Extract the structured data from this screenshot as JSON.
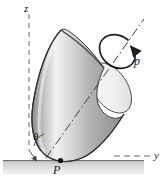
{
  "figure": {
    "background_color": "#ffffff",
    "width": 167,
    "height": 181
  },
  "axes": {
    "vertical": {
      "label": "z",
      "style": "dashed",
      "color": "#555555",
      "orientation": "vertical"
    },
    "horizontal": {
      "label": "y",
      "style": "dashed",
      "color": "#555555",
      "orientation": "horizontal"
    },
    "cone_axis": {
      "label": "",
      "style": "dash-dot",
      "color": "#4a4a4a"
    }
  },
  "labels": {
    "z_axis": "z",
    "y_axis": "y",
    "contact_point": "P",
    "half_angle": "θ",
    "spin_rate": "p"
  },
  "body": {
    "shape": "cone",
    "fill_light": "#fdfdfd",
    "fill_mid": "#c9c9c9",
    "fill_dark": "#8f8f8f",
    "outline_color": "#3a3a3a",
    "base_fill": "#f2f2f2"
  },
  "ground": {
    "name": "ground-plane",
    "fill_top": "#b8b8b8",
    "fill_bottom": "#f4f4f4",
    "edge_color": "#5a5a5a"
  },
  "spin_arrow": {
    "name": "spin-rotation-arrow",
    "color": "#1f1f1f",
    "direction": "clockwise-about-cone-axis"
  },
  "contact_marker": {
    "name": "contact-point-dot",
    "color": "#111111"
  }
}
